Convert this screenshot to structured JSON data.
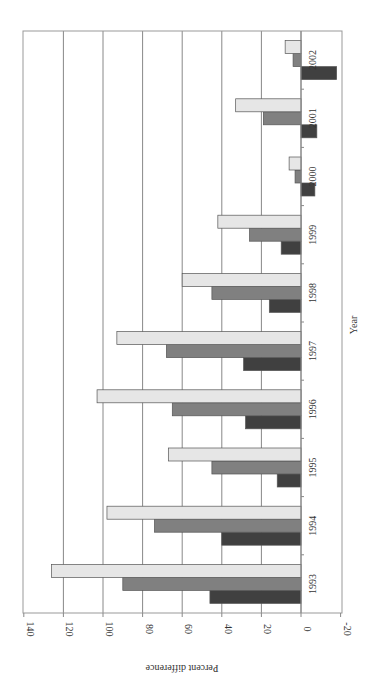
{
  "chart_data": {
    "type": "bar",
    "orientation": "horizontal (rotated 90°)",
    "title": "",
    "xlabel": "Year",
    "ylabel": "Percent difference",
    "ylim": [
      -20,
      140
    ],
    "yticks": [
      140,
      120,
      100,
      80,
      60,
      40,
      20,
      0,
      -20
    ],
    "grid": true,
    "legend": null,
    "categories": [
      "1993",
      "1994",
      "1995",
      "1996",
      "1997",
      "1998",
      "1999",
      "2000",
      "2001",
      "2002"
    ],
    "series": [
      {
        "name": "Series 1 (dark)",
        "color": "#404040",
        "values": [
          46,
          40,
          12,
          28,
          29,
          16,
          10,
          -7,
          -8,
          -18
        ]
      },
      {
        "name": "Series 2 (medium)",
        "color": "#808080",
        "values": [
          90,
          74,
          45,
          65,
          68,
          45,
          26,
          3,
          19,
          4
        ]
      },
      {
        "name": "Series 3 (light)",
        "color": "#e6e6e6",
        "values": [
          126,
          98,
          67,
          103,
          93,
          60,
          42,
          6,
          33,
          8
        ]
      }
    ]
  }
}
